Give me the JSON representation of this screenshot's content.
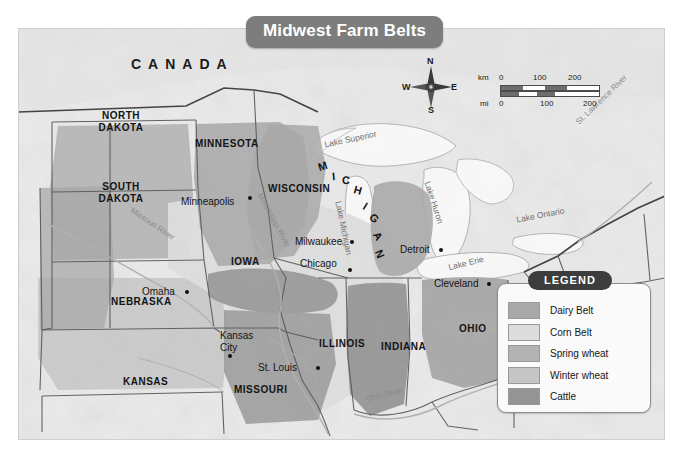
{
  "title": "Midwest Farm Belts",
  "country_label": "CANADA",
  "states": [
    {
      "name": "NORTH\nDAKOTA",
      "line1": "NORTH",
      "line2": "DAKOTA"
    },
    {
      "name": "SOUTH\nDAKOTA",
      "line1": "SOUTH",
      "line2": "DAKOTA"
    },
    {
      "name": "MINNESOTA",
      "line1": "MINNESOTA",
      "line2": ""
    },
    {
      "name": "WISCONSIN",
      "line1": "WISCONSIN",
      "line2": ""
    },
    {
      "name": "MICHIGAN",
      "line1": "MICHIGAN",
      "line2": ""
    },
    {
      "name": "IOWA",
      "line1": "IOWA",
      "line2": ""
    },
    {
      "name": "NEBRASKA",
      "line1": "NEBRASKA",
      "line2": ""
    },
    {
      "name": "ILLINOIS",
      "line1": "ILLINOIS",
      "line2": ""
    },
    {
      "name": "INDIANA",
      "line1": "INDIANA",
      "line2": ""
    },
    {
      "name": "OHIO",
      "line1": "OHIO",
      "line2": ""
    },
    {
      "name": "KANSAS",
      "line1": "KANSAS",
      "line2": ""
    },
    {
      "name": "MISSOURI",
      "line1": "MISSOURI",
      "line2": ""
    }
  ],
  "state_labels": {
    "north_dakota_1": "NORTH",
    "north_dakota_2": "DAKOTA",
    "south_dakota_1": "SOUTH",
    "south_dakota_2": "DAKOTA",
    "minnesota": "MINNESOTA",
    "wisconsin": "WISCONSIN",
    "michigan": "MICHIGAN",
    "iowa": "IOWA",
    "nebraska": "NEBRASKA",
    "illinois": "ILLINOIS",
    "indiana": "INDIANA",
    "ohio": "OHIO",
    "kansas": "KANSAS",
    "missouri": "MISSOURI"
  },
  "cities": [
    {
      "label": "Minneapolis"
    },
    {
      "label": "Milwaukee"
    },
    {
      "label": "Chicago"
    },
    {
      "label": "Detroit"
    },
    {
      "label": "Cleveland"
    },
    {
      "label": "Omaha"
    },
    {
      "label": "Kansas City"
    },
    {
      "label": "St. Louis"
    }
  ],
  "city_labels": {
    "minneapolis": "Minneapolis",
    "milwaukee": "Milwaukee",
    "chicago": "Chicago",
    "detroit": "Detroit",
    "cleveland": "Cleveland",
    "omaha": "Omaha",
    "kansas_city_1": "Kansas",
    "kansas_city_2": "City",
    "st_louis": "St. Louis"
  },
  "water_labels": {
    "lake_superior": "Lake Superior",
    "lake_michigan": "Lake Michigan",
    "lake_huron": "Lake Huron",
    "lake_erie": "Lake Erie",
    "lake_ontario": "Lake Ontario",
    "st_lawrence_river": "St. Lawrence River",
    "mississippi_river": "Mississippi River",
    "missouri_river": "Missouri River",
    "ohio_river": "Ohio River"
  },
  "compass": {
    "north": "N",
    "east": "E",
    "south": "S",
    "west": "W"
  },
  "scale": {
    "km_unit": "km",
    "mi_unit": "mi",
    "km_ticks": [
      "0",
      "100",
      "200"
    ],
    "mi_ticks": [
      "0",
      "100",
      "200"
    ],
    "km_0": "0",
    "km_100": "100",
    "km_200": "200",
    "mi_0": "0",
    "mi_100": "100",
    "mi_200": "200"
  },
  "legend": {
    "title": "LEGEND",
    "items": [
      {
        "label": "Dairy Belt",
        "color": "#a9a9a9"
      },
      {
        "label": "Corn Belt",
        "color": "#dcdcdc"
      },
      {
        "label": "Spring wheat",
        "color": "#b3b3b3"
      },
      {
        "label": "Winter wheat",
        "color": "#c6c6c6"
      },
      {
        "label": "Cattle",
        "color": "#949494"
      }
    ]
  },
  "colors": {
    "map_background": "#efefef",
    "land": "#e8e8e8",
    "water": "#f7f7f7",
    "title_banner": "#7d7d7d",
    "legend_title_pill": "#3c3c3c",
    "border": "#4a4a4a"
  }
}
